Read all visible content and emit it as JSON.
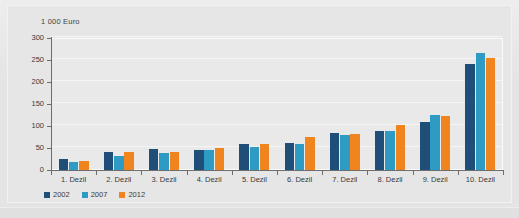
{
  "chart_data": {
    "type": "bar",
    "title": "",
    "xlabel": "",
    "ylabel": "1 000 Euro",
    "axis_unit_label": "1 000 Euro",
    "ylim": [
      0,
      300
    ],
    "ytick_step": 50,
    "ytick_labels": [
      "0",
      "50",
      "100",
      "150",
      "200",
      "250",
      "300"
    ],
    "grid": true,
    "legend_position": "bottom-left",
    "categories": [
      "1. Dezil",
      "2. Dezil",
      "3. Dezil",
      "4. Dezil",
      "5. Dezil",
      "6. Dezil",
      "7. Dezil",
      "8. Dezil",
      "9. Dezil",
      "10. Dezil"
    ],
    "series": [
      {
        "name": "2002",
        "color": "#1f4e79",
        "values": [
          25,
          41,
          47,
          45,
          59,
          61,
          84,
          89,
          110,
          240
        ]
      },
      {
        "name": "2007",
        "color": "#2e9bc4",
        "values": [
          19,
          32,
          39,
          46,
          53,
          60,
          80,
          88,
          125,
          267
        ]
      },
      {
        "name": "2012",
        "color": "#f0841e",
        "values": [
          21,
          41,
          42,
          51,
          59,
          75,
          81,
          102,
          123,
          254
        ]
      }
    ]
  },
  "legend": {
    "items": [
      {
        "label": "2002",
        "color": "#1f4e79"
      },
      {
        "label": "2007",
        "color": "#2e9bc4"
      },
      {
        "label": "2012",
        "color": "#f0841e"
      }
    ]
  },
  "colors": {
    "series_2002": "#1f4e79",
    "series_2007": "#2e9bc4",
    "series_2012": "#f0841e",
    "page_background": "#e4e4e4",
    "plot_background": "#e9e9e9",
    "axis": "#6d6d6d",
    "gridline": "#f5f5f5",
    "text": "#3a3a3a"
  }
}
